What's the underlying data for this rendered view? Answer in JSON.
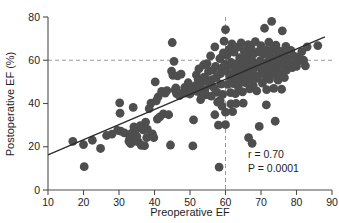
{
  "chart_data": {
    "type": "scatter",
    "title": "",
    "xlabel": "Preoperative EF",
    "ylabel": "Postoperative EF (%)",
    "xlim": [
      10,
      90
    ],
    "ylim": [
      0,
      80
    ],
    "xticks": [
      10,
      20,
      30,
      40,
      50,
      60,
      70,
      80,
      90
    ],
    "yticks": [
      0,
      20,
      40,
      60,
      80
    ],
    "xtick_labels": [
      "10",
      "20",
      "30",
      "40",
      "50",
      "60",
      "70",
      "80",
      "90"
    ],
    "ytick_labels": [
      "0",
      "20",
      "40",
      "60",
      "80"
    ],
    "grid": false,
    "legend": "none",
    "marker_color": "#4e4e4e",
    "marker_size": 4.4,
    "reference_lines": [
      {
        "orientation": "horizontal",
        "value": 60,
        "style": "dashed",
        "color": "#9a9a9a"
      },
      {
        "orientation": "vertical",
        "value": 60,
        "style": "dashed",
        "color": "#9a9a9a"
      }
    ],
    "fit_line": {
      "type": "linear-regression",
      "color": "#2b2b2b",
      "x_start": 10,
      "y_start": 16.2,
      "x_end": 88,
      "y_end": 70.8
    },
    "annotations": [
      {
        "name": "correlation",
        "text": "r = 0.70",
        "italic": false,
        "x": 72,
        "y": 16.5
      },
      {
        "name": "p-value",
        "text": "P = 0.0001",
        "italic_prefix": "P",
        "text_rest": " = 0.0001",
        "x": 72,
        "y": 11.5
      }
    ],
    "r_label": "r = 0.70",
    "p_label_italic": "P",
    "p_label_rest": " = 0.0001",
    "points": [
      [
        17.0,
        22.5
      ],
      [
        20.0,
        21.0
      ],
      [
        20.2,
        10.8
      ],
      [
        22.5,
        23.0
      ],
      [
        24.8,
        19.2
      ],
      [
        26.5,
        25.2
      ],
      [
        28.0,
        25.8
      ],
      [
        29.6,
        27.6
      ],
      [
        30.2,
        40.3
      ],
      [
        30.3,
        35.5
      ],
      [
        30.5,
        27.2
      ],
      [
        31.5,
        26.4
      ],
      [
        32.8,
        22.5
      ],
      [
        33.0,
        23.6
      ],
      [
        33.2,
        24.4
      ],
      [
        33.3,
        21.4
      ],
      [
        33.5,
        26.2
      ],
      [
        34.0,
        38.2
      ],
      [
        34.2,
        29.2
      ],
      [
        34.4,
        27.6
      ],
      [
        34.6,
        25.5
      ],
      [
        34.8,
        22.6
      ],
      [
        35.0,
        24.8
      ],
      [
        35.2,
        28.6
      ],
      [
        35.5,
        22.2
      ],
      [
        36.0,
        29.8
      ],
      [
        36.3,
        20.6
      ],
      [
        36.8,
        27.8
      ],
      [
        37.2,
        20.5
      ],
      [
        37.5,
        31.4
      ],
      [
        37.8,
        24.2
      ],
      [
        38.0,
        28.0
      ],
      [
        38.5,
        37.6
      ],
      [
        39.0,
        40.2
      ],
      [
        39.4,
        26.0
      ],
      [
        39.8,
        24.2
      ],
      [
        40.2,
        50.0
      ],
      [
        40.5,
        41.2
      ],
      [
        40.8,
        32.8
      ],
      [
        41.0,
        43.0
      ],
      [
        41.5,
        33.8
      ],
      [
        42.0,
        45.6
      ],
      [
        42.5,
        35.2
      ],
      [
        43.0,
        44.8
      ],
      [
        43.5,
        46.0
      ],
      [
        44.0,
        34.8
      ],
      [
        44.5,
        20.8
      ],
      [
        44.8,
        55.0
      ],
      [
        45.0,
        68.2
      ],
      [
        45.2,
        53.0
      ],
      [
        45.5,
        59.5
      ],
      [
        45.8,
        46.2
      ],
      [
        46.0,
        47.2
      ],
      [
        46.2,
        44.6
      ],
      [
        46.5,
        52.8
      ],
      [
        47.0,
        43.6
      ],
      [
        47.5,
        53.6
      ],
      [
        48.0,
        45.0
      ],
      [
        48.5,
        47.4
      ],
      [
        49.0,
        44.8
      ],
      [
        49.5,
        49.6
      ],
      [
        50.0,
        44.4
      ],
      [
        50.5,
        46.6
      ],
      [
        50.8,
        20.4
      ],
      [
        51.0,
        32.4
      ],
      [
        51.5,
        48.2
      ],
      [
        51.8,
        53.2
      ],
      [
        52.0,
        45.6
      ],
      [
        52.3,
        51.2
      ],
      [
        52.5,
        56.0
      ],
      [
        52.8,
        48.0
      ],
      [
        53.0,
        41.8
      ],
      [
        53.3,
        43.6
      ],
      [
        53.5,
        50.0
      ],
      [
        53.8,
        57.8
      ],
      [
        54.0,
        52.2
      ],
      [
        54.2,
        46.2
      ],
      [
        54.5,
        44.0
      ],
      [
        54.8,
        58.4
      ],
      [
        55.0,
        50.6
      ],
      [
        55.2,
        54.8
      ],
      [
        55.5,
        48.6
      ],
      [
        55.8,
        62.0
      ],
      [
        56.0,
        43.4
      ],
      [
        56.2,
        51.0
      ],
      [
        56.5,
        55.4
      ],
      [
        56.8,
        47.2
      ],
      [
        57.0,
        66.2
      ],
      [
        57.2,
        57.2
      ],
      [
        57.4,
        52.0
      ],
      [
        57.6,
        45.2
      ],
      [
        57.8,
        40.6
      ],
      [
        58.0,
        30.0
      ],
      [
        58.2,
        10.6
      ],
      [
        58.4,
        60.8
      ],
      [
        58.6,
        53.8
      ],
      [
        58.8,
        49.0
      ],
      [
        59.0,
        56.4
      ],
      [
        59.2,
        44.2
      ],
      [
        59.4,
        63.4
      ],
      [
        59.6,
        68.8
      ],
      [
        59.8,
        58.2
      ],
      [
        60.0,
        74.2
      ],
      [
        60.0,
        36.0
      ],
      [
        60.0,
        30.2
      ],
      [
        60.2,
        55.2
      ],
      [
        60.4,
        62.2
      ],
      [
        60.6,
        48.8
      ],
      [
        60.8,
        57.6
      ],
      [
        61.0,
        65.0
      ],
      [
        61.2,
        52.4
      ],
      [
        61.4,
        45.0
      ],
      [
        61.6,
        59.0
      ],
      [
        61.8,
        67.6
      ],
      [
        62.0,
        54.0
      ],
      [
        62.2,
        49.2
      ],
      [
        62.4,
        63.8
      ],
      [
        62.6,
        57.0
      ],
      [
        62.8,
        44.6
      ],
      [
        63.0,
        51.8
      ],
      [
        63.2,
        66.0
      ],
      [
        63.4,
        58.6
      ],
      [
        63.6,
        47.8
      ],
      [
        63.8,
        54.6
      ],
      [
        64.0,
        61.2
      ],
      [
        64.2,
        50.2
      ],
      [
        64.4,
        68.0
      ],
      [
        64.6,
        56.2
      ],
      [
        64.8,
        45.4
      ],
      [
        65.0,
        52.6
      ],
      [
        65.2,
        64.4
      ],
      [
        65.4,
        59.4
      ],
      [
        65.6,
        49.6
      ],
      [
        65.8,
        55.8
      ],
      [
        66.0,
        62.6
      ],
      [
        66.2,
        53.4
      ],
      [
        66.4,
        67.2
      ],
      [
        66.6,
        57.4
      ],
      [
        66.8,
        46.8
      ],
      [
        67.0,
        51.4
      ],
      [
        67.2,
        65.6
      ],
      [
        67.4,
        60.2
      ],
      [
        67.6,
        55.0
      ],
      [
        67.8,
        48.4
      ],
      [
        68.0,
        63.0
      ],
      [
        68.2,
        53.0
      ],
      [
        68.4,
        68.6
      ],
      [
        68.6,
        58.0
      ],
      [
        68.8,
        45.8
      ],
      [
        69.0,
        51.6
      ],
      [
        69.2,
        64.0
      ],
      [
        69.4,
        56.8
      ],
      [
        69.5,
        29.4
      ],
      [
        69.8,
        59.8
      ],
      [
        70.0,
        66.8
      ],
      [
        70.2,
        54.4
      ],
      [
        70.4,
        49.4
      ],
      [
        70.6,
        62.8
      ],
      [
        70.8,
        57.6
      ],
      [
        71.0,
        74.8
      ],
      [
        71.2,
        52.8
      ],
      [
        71.4,
        64.8
      ],
      [
        71.6,
        46.4
      ],
      [
        71.8,
        59.2
      ],
      [
        72.0,
        55.6
      ],
      [
        72.2,
        68.4
      ],
      [
        72.4,
        51.2
      ],
      [
        72.6,
        61.8
      ],
      [
        72.8,
        57.0
      ],
      [
        73.0,
        78.0
      ],
      [
        73.2,
        65.2
      ],
      [
        73.4,
        53.6
      ],
      [
        73.6,
        47.0
      ],
      [
        73.8,
        59.6
      ],
      [
        74.0,
        31.8
      ],
      [
        74.2,
        67.0
      ],
      [
        74.4,
        56.0
      ],
      [
        74.6,
        62.4
      ],
      [
        74.8,
        50.8
      ],
      [
        75.0,
        58.8
      ],
      [
        75.2,
        64.2
      ],
      [
        75.4,
        54.2
      ],
      [
        75.6,
        60.6
      ],
      [
        75.8,
        46.6
      ],
      [
        76.0,
        73.6
      ],
      [
        76.2,
        57.8
      ],
      [
        76.4,
        63.2
      ],
      [
        76.6,
        52.0
      ],
      [
        76.8,
        59.0
      ],
      [
        77.0,
        66.4
      ],
      [
        77.2,
        55.4
      ],
      [
        77.4,
        61.0
      ],
      [
        78.0,
        58.4
      ],
      [
        78.4,
        64.6
      ],
      [
        78.8,
        56.6
      ],
      [
        79.2,
        62.0
      ],
      [
        79.6,
        59.4
      ],
      [
        80.0,
        57.2
      ],
      [
        80.5,
        61.6
      ],
      [
        81.0,
        59.8
      ],
      [
        81.5,
        64.0
      ],
      [
        82.0,
        60.0
      ],
      [
        82.5,
        57.4
      ],
      [
        83.0,
        66.2
      ],
      [
        86.0,
        66.8
      ],
      [
        58.5,
        41.4
      ],
      [
        59.0,
        38.8
      ],
      [
        61.5,
        39.8
      ],
      [
        63.0,
        40.0
      ],
      [
        65.0,
        40.2
      ],
      [
        66.5,
        24.2
      ],
      [
        67.5,
        21.6
      ],
      [
        71.5,
        39.4
      ],
      [
        57.0,
        34.8
      ],
      [
        62.0,
        36.2
      ]
    ]
  }
}
